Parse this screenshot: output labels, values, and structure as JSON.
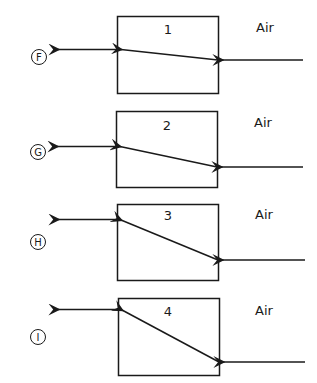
{
  "diagram": {
    "medium_label": "Air",
    "panels": [
      {
        "block_number": "1",
        "output_label": "F",
        "medium": "Air"
      },
      {
        "block_number": "2",
        "output_label": "G",
        "medium": "Air"
      },
      {
        "block_number": "3",
        "output_label": "H",
        "medium": "Air"
      },
      {
        "block_number": "4",
        "output_label": "I",
        "medium": "Air"
      }
    ]
  }
}
